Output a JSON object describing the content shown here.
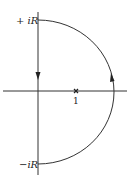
{
  "diagram": {
    "type": "contour-plot",
    "labels": {
      "top": "+ iR",
      "bottom": "−iR",
      "point": "1"
    },
    "contour": {
      "shape": "semicircle-right-half-plane",
      "direction": "counterclockwise",
      "arrows": [
        "down-on-imaginary-axis",
        "up-on-arc"
      ]
    },
    "marked_point": {
      "symbol": "x",
      "value": "1"
    },
    "colors": {
      "stroke": "#222222",
      "background": "#ffffff"
    }
  }
}
